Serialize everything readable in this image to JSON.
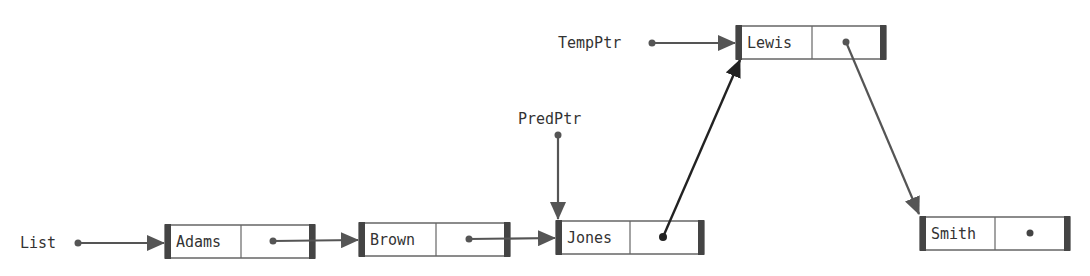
{
  "colors": {
    "line": "#555555",
    "dark_line": "#222222",
    "box_border": "#666666",
    "bar": "#444444"
  },
  "pointers": {
    "list": {
      "label": "List"
    },
    "pred_ptr": {
      "label": "PredPtr"
    },
    "temp_ptr": {
      "label": "TempPtr"
    }
  },
  "nodes": [
    {
      "name": "Adams",
      "next": "Brown"
    },
    {
      "name": "Brown",
      "next": "Jones"
    },
    {
      "name": "Jones",
      "next": "Lewis"
    },
    {
      "name": "Lewis",
      "next": "Smith"
    },
    {
      "name": "Smith",
      "next": null
    }
  ]
}
